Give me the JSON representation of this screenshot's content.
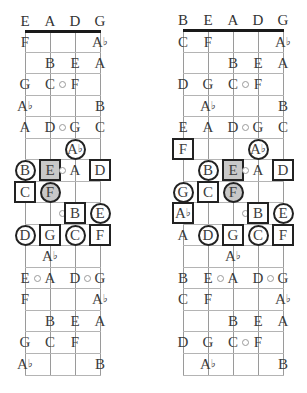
{
  "diagrams": [
    {
      "id": "left",
      "strings": [
        "E",
        "A",
        "D",
        "G"
      ],
      "string_x": [
        25,
        50,
        75,
        100
      ],
      "nut_y": 30,
      "bottom_y": 375,
      "fret_lines_y": [
        52,
        73,
        95,
        116,
        138,
        159,
        181,
        202,
        224,
        245,
        267,
        288,
        310,
        331,
        353,
        375
      ],
      "row_centers_y": [
        42,
        63,
        84,
        106,
        127,
        149,
        170,
        192,
        213,
        235,
        256,
        278,
        299,
        321,
        342,
        364
      ],
      "rows": [
        [
          {
            "s": 0,
            "n": "F"
          },
          {
            "s": 3,
            "n": "A♭"
          }
        ],
        [
          {
            "s": 1,
            "n": "B"
          },
          {
            "s": 2,
            "n": "E"
          },
          {
            "s": 3,
            "n": "A"
          }
        ],
        [
          {
            "s": 0,
            "n": "G"
          },
          {
            "s": 1,
            "n": "C"
          },
          {
            "dot": 1.5
          },
          {
            "s": 2,
            "n": "F"
          }
        ],
        [
          {
            "s": 0,
            "n": "A♭"
          },
          {
            "s": 3,
            "n": "B"
          }
        ],
        [
          {
            "s": 0,
            "n": "A"
          },
          {
            "s": 1,
            "n": "D"
          },
          {
            "dot": 1.5
          },
          {
            "s": 2,
            "n": "G"
          },
          {
            "s": 3,
            "n": "C"
          }
        ],
        [
          {
            "s": 2,
            "n": "A♭",
            "shape": "circle"
          }
        ],
        [
          {
            "s": 0,
            "n": "B",
            "shape": "circle"
          },
          {
            "s": 1,
            "n": "E",
            "shape": "square",
            "fill": "gray"
          },
          {
            "dot": 1.5
          },
          {
            "s": 2,
            "n": "A"
          },
          {
            "s": 3,
            "n": "D",
            "shape": "square"
          }
        ],
        [
          {
            "s": 0,
            "n": "C",
            "shape": "square"
          },
          {
            "s": 1,
            "n": "F",
            "shape": "circle",
            "fill": "gray"
          }
        ],
        [
          {
            "dot": 1.5
          },
          {
            "s": 2,
            "n": "B",
            "shape": "square"
          },
          {
            "s": 3,
            "n": "E",
            "shape": "circle"
          }
        ],
        [
          {
            "s": 0,
            "n": "D",
            "shape": "circle"
          },
          {
            "s": 1,
            "n": "G",
            "shape": "square"
          },
          {
            "s": 2,
            "n": "C",
            "shape": "circle"
          },
          {
            "s": 3,
            "n": "F",
            "shape": "square"
          }
        ],
        [
          {
            "s": 1,
            "n": "A♭"
          }
        ],
        [
          {
            "s": 0,
            "n": "E"
          },
          {
            "dot": 0.5
          },
          {
            "s": 1,
            "n": "A"
          },
          {
            "s": 2,
            "n": "D"
          },
          {
            "dot": 2.5
          },
          {
            "s": 3,
            "n": "G"
          }
        ],
        [
          {
            "s": 0,
            "n": "F"
          },
          {
            "s": 3,
            "n": "A♭"
          }
        ],
        [
          {
            "s": 1,
            "n": "B"
          },
          {
            "s": 2,
            "n": "E"
          },
          {
            "s": 3,
            "n": "A"
          }
        ],
        [
          {
            "s": 0,
            "n": "G"
          },
          {
            "s": 1,
            "n": "C"
          },
          {
            "s": 2,
            "n": "F"
          }
        ],
        [
          {
            "s": 0,
            "n": "A♭"
          },
          {
            "s": 3,
            "n": "B"
          }
        ]
      ]
    },
    {
      "id": "right",
      "strings": [
        "B",
        "E",
        "A",
        "D",
        "G"
      ],
      "string_x": [
        183,
        208,
        233,
        258,
        283
      ],
      "nut_y": 29,
      "bottom_y": 375,
      "fret_lines_y": [
        52,
        73,
        95,
        116,
        138,
        159,
        181,
        202,
        224,
        245,
        267,
        288,
        310,
        331,
        353,
        375
      ],
      "row_centers_y": [
        42,
        63,
        84,
        106,
        127,
        149,
        170,
        192,
        213,
        235,
        256,
        278,
        299,
        321,
        342,
        364
      ],
      "rows": [
        [
          {
            "s": 0,
            "n": "C"
          },
          {
            "s": 1,
            "n": "F"
          },
          {
            "s": 4,
            "n": "A♭"
          }
        ],
        [
          {
            "s": 2,
            "n": "B"
          },
          {
            "s": 3,
            "n": "E"
          },
          {
            "s": 4,
            "n": "A"
          }
        ],
        [
          {
            "s": 0,
            "n": "D"
          },
          {
            "s": 1,
            "n": "G"
          },
          {
            "s": 2,
            "n": "C"
          },
          {
            "dot": 2.5
          },
          {
            "s": 3,
            "n": "F"
          }
        ],
        [
          {
            "s": 1,
            "n": "A♭"
          },
          {
            "s": 4,
            "n": "B"
          }
        ],
        [
          {
            "s": 0,
            "n": "E"
          },
          {
            "s": 1,
            "n": "A"
          },
          {
            "s": 2,
            "n": "D"
          },
          {
            "dot": 2.5
          },
          {
            "s": 3,
            "n": "G"
          },
          {
            "s": 4,
            "n": "C"
          }
        ],
        [
          {
            "s": 0,
            "n": "F",
            "shape": "square"
          },
          {
            "s": 3,
            "n": "A♭",
            "shape": "circle"
          }
        ],
        [
          {
            "s": 1,
            "n": "B",
            "shape": "circle"
          },
          {
            "s": 2,
            "n": "E",
            "shape": "square",
            "fill": "gray"
          },
          {
            "dot": 2.5
          },
          {
            "s": 3,
            "n": "A"
          },
          {
            "s": 4,
            "n": "D",
            "shape": "square"
          }
        ],
        [
          {
            "s": 0,
            "n": "G",
            "shape": "circle"
          },
          {
            "s": 1,
            "n": "C",
            "shape": "square"
          },
          {
            "s": 2,
            "n": "F",
            "shape": "circle",
            "fill": "gray"
          }
        ],
        [
          {
            "s": 0,
            "n": "A♭",
            "shape": "square"
          },
          {
            "dot": 2.5
          },
          {
            "s": 3,
            "n": "B",
            "shape": "square"
          },
          {
            "s": 4,
            "n": "E",
            "shape": "circle"
          }
        ],
        [
          {
            "s": 0,
            "n": "A"
          },
          {
            "s": 1,
            "n": "D",
            "shape": "circle"
          },
          {
            "s": 2,
            "n": "G",
            "shape": "square"
          },
          {
            "s": 3,
            "n": "C",
            "shape": "circle"
          },
          {
            "s": 4,
            "n": "F",
            "shape": "square"
          }
        ],
        [
          {
            "s": 2,
            "n": "A♭"
          }
        ],
        [
          {
            "s": 0,
            "n": "B"
          },
          {
            "s": 1,
            "n": "E"
          },
          {
            "dot": 1.5
          },
          {
            "s": 2,
            "n": "A"
          },
          {
            "s": 3,
            "n": "D"
          },
          {
            "dot": 3.5
          },
          {
            "s": 4,
            "n": "G"
          }
        ],
        [
          {
            "s": 0,
            "n": "C"
          },
          {
            "s": 1,
            "n": "F"
          },
          {
            "s": 4,
            "n": "A♭"
          }
        ],
        [
          {
            "s": 2,
            "n": "B"
          },
          {
            "s": 3,
            "n": "E"
          },
          {
            "s": 4,
            "n": "A"
          }
        ],
        [
          {
            "s": 0,
            "n": "D"
          },
          {
            "s": 1,
            "n": "G"
          },
          {
            "s": 2,
            "n": "C"
          },
          {
            "dot": 2.5
          },
          {
            "s": 3,
            "n": "F"
          }
        ],
        [
          {
            "s": 1,
            "n": "A♭"
          },
          {
            "s": 4,
            "n": "B"
          }
        ]
      ]
    }
  ],
  "legend": {
    "circle": "circled note",
    "square": "boxed note",
    "gray_fill": "highlighted note",
    "small_circle": "fret marker dot"
  }
}
